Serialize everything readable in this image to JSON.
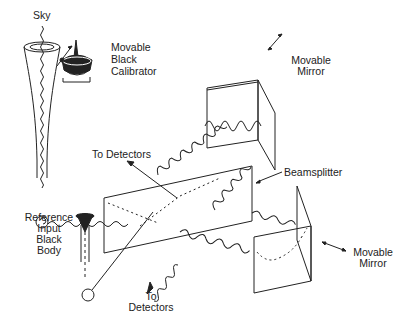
{
  "diagram": {
    "type": "optical-schematic",
    "labels": {
      "sky": "Sky",
      "calibrator": [
        "Movable",
        "Black",
        "Calibrator"
      ],
      "top_mirror": [
        "Movable",
        "Mirror"
      ],
      "right_mirror": [
        "Movable",
        "Mirror"
      ],
      "beamsplitter": "Beamsplitter",
      "to_detectors_top": "To Detectors",
      "to_detectors_bottom": [
        "To",
        "Detectors"
      ],
      "reference": [
        "Reference",
        "Input",
        "Black",
        "Body"
      ]
    },
    "colors": {
      "ink": "#222222",
      "background": "#ffffff"
    }
  }
}
